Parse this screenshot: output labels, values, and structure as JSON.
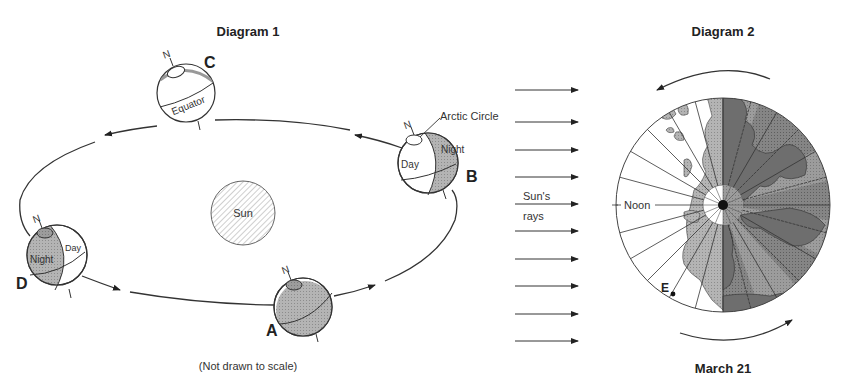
{
  "diagram1": {
    "title": "Diagram 1",
    "sun_label": "Sun",
    "note": "(Not drawn to scale)",
    "positions": [
      {
        "letter": "A",
        "day_label": "",
        "night_label": ""
      },
      {
        "letter": "B",
        "day_label": "Day",
        "night_label": "Night",
        "extra_label": "Arctic Circle"
      },
      {
        "letter": "C",
        "equator_label": "Equator"
      },
      {
        "letter": "D",
        "day_label": "Day",
        "night_label": "Night"
      }
    ],
    "north_label": "N"
  },
  "rays": {
    "label_line1": "Sun's",
    "label_line2": "rays",
    "count": 10
  },
  "diagram2": {
    "title": "Diagram 2",
    "noon_label": "Noon",
    "point_label": "E",
    "date_label": "March 21"
  },
  "colors": {
    "line": "#333333",
    "night_fill": "#a9a9a9",
    "night_dark": "#7f7f7f",
    "land_light": "#c8c8c8",
    "land_dark": "#6e6e6e",
    "sun_hatch": "#9a9a9a"
  }
}
